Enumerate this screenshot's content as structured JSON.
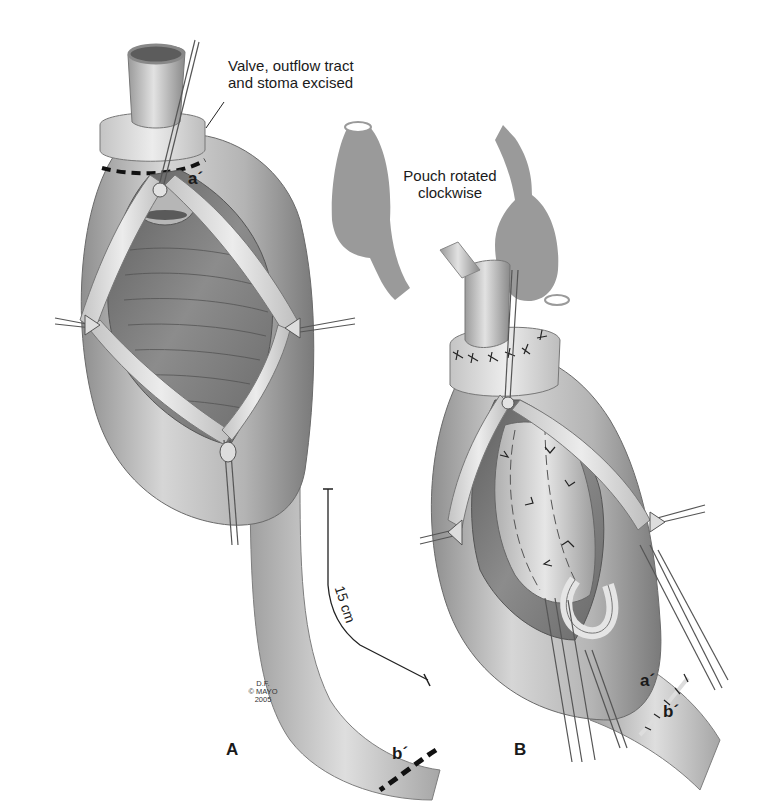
{
  "figure": {
    "panels": [
      {
        "id": "A",
        "label": "A",
        "callout": {
          "line1": "Valve, outflow tract",
          "line2": "and stoma excised"
        },
        "markers": {
          "top": "a´",
          "bottom": "b´"
        },
        "scale_bar": {
          "label": "15 cm"
        },
        "credit": {
          "line1": "D.F.",
          "line2": "© MAYO",
          "line3": "2005"
        }
      },
      {
        "id": "B",
        "label": "B",
        "markers": {
          "top": "a´",
          "bottom": "b´"
        }
      }
    ],
    "inset": {
      "caption_line1": "Pouch rotated",
      "caption_line2": "clockwise"
    },
    "colors": {
      "background": "#ffffff",
      "tissue_light": "#d9d9d9",
      "tissue_mid": "#a8a8a8",
      "tissue_dark": "#6e6e6e",
      "inset_silhouette": "#9a9a9a",
      "ink": "#1a1a1a"
    }
  }
}
